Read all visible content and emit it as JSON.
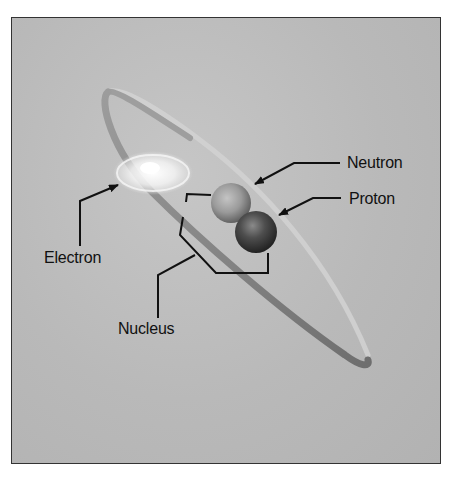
{
  "diagram": {
    "labels": {
      "neutron": "Neutron",
      "proton": "Proton",
      "electron": "Electron",
      "nucleus": "Nucleus"
    },
    "colors": {
      "background": "#b9b9b9",
      "frame_border": "#333333",
      "orbit_back": "#a0a0a0",
      "orbit_front": "#7a7a7a",
      "neutron": "#9a9a9a",
      "proton": "#4a4a4a",
      "electron_glow": "#ffffff",
      "leader_lines": "#111111"
    },
    "components": [
      {
        "name": "Electron",
        "description": "glowing particle on the orbit"
      },
      {
        "name": "Neutron",
        "description": "lighter sphere in nucleus"
      },
      {
        "name": "Proton",
        "description": "darker sphere in nucleus"
      },
      {
        "name": "Nucleus",
        "description": "bracketed group of neutron and proton"
      }
    ]
  }
}
